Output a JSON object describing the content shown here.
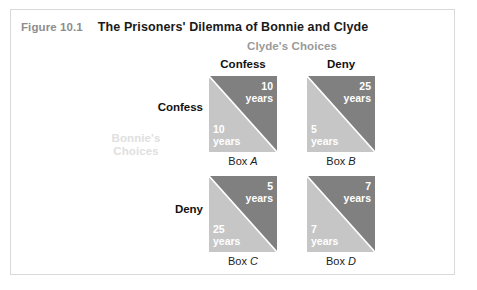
{
  "page": {
    "partial_top_text": "",
    "figure_number": "Figure 10.1",
    "figure_title": "The Prisoners' Dilemma of Bonnie and Clyde"
  },
  "matrix": {
    "column_axis_label": "Clyde's Choices",
    "row_axis_label_line1": "Bonnie's",
    "row_axis_label_line2": "Choices",
    "column_headers": [
      "Confess",
      "Deny"
    ],
    "row_headers": [
      "Confess",
      "Deny"
    ],
    "cells": [
      {
        "id": "A",
        "box_label_prefix": "Box ",
        "box_label_letter": "A",
        "row": "Confess",
        "column": "Confess",
        "upper_value": "10",
        "upper_unit": "years",
        "lower_value": "10",
        "lower_unit": "years"
      },
      {
        "id": "B",
        "box_label_prefix": "Box ",
        "box_label_letter": "B",
        "row": "Confess",
        "column": "Deny",
        "upper_value": "25",
        "upper_unit": "years",
        "lower_value": "5",
        "lower_unit": "years"
      },
      {
        "id": "C",
        "box_label_prefix": "Box ",
        "box_label_letter": "C",
        "row": "Deny",
        "column": "Confess",
        "upper_value": "5",
        "upper_unit": "years",
        "lower_value": "25",
        "lower_unit": "years"
      },
      {
        "id": "D",
        "box_label_prefix": "Box ",
        "box_label_letter": "D",
        "row": "Deny",
        "column": "Deny",
        "upper_value": "7",
        "upper_unit": "years",
        "lower_value": "7",
        "lower_unit": "years"
      }
    ]
  },
  "colors": {
    "upper_triangle": "#808080",
    "lower_triangle": "#c6c6c6",
    "frame_border": "#d9d9d9",
    "figure_number_text": "#8d8d8d",
    "title_text": "#1a1a1a",
    "axis_label_clyde": "#9a9a9a",
    "axis_label_bonnie": "#e0e0e0",
    "payoff_text": "#ffffff"
  }
}
